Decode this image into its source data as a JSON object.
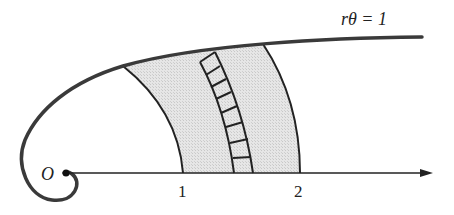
{
  "diagram": {
    "curve_label": "rθ = 1",
    "origin_label": "O",
    "tick_labels": [
      "1",
      "2"
    ],
    "colors": {
      "stroke": "#222222",
      "curve": "#3a3a3a",
      "fill": "#e2e2e2"
    }
  }
}
